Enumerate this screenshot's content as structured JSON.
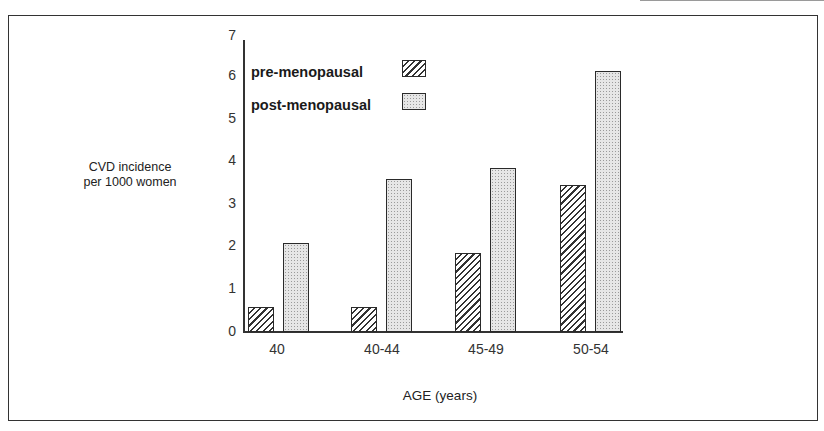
{
  "chart_data": {
    "type": "bar",
    "title": "",
    "xlabel": "AGE (years)",
    "ylabel": "CVD incidence per 1000 women",
    "ylabel_lines": [
      "CVD incidence",
      "per 1000 women"
    ],
    "categories": [
      "40",
      "40-44",
      "45-49",
      "50-54"
    ],
    "series": [
      {
        "name": "pre-menopausal",
        "pattern": "diagonal-hatch",
        "values": [
          0.6,
          0.6,
          1.85,
          3.45
        ]
      },
      {
        "name": "post-menopausal",
        "pattern": "stipple",
        "values": [
          2.1,
          3.6,
          3.85,
          6.15
        ]
      }
    ],
    "ylim": [
      0,
      7
    ],
    "yticks": [
      0,
      1,
      2,
      3,
      4,
      5,
      6,
      7
    ],
    "grid": false,
    "legend_position": "upper-left inside plot"
  },
  "colors": {
    "frame": "#333333",
    "bar_outline": "#2a2a2a",
    "stipple_fill": "#e6e6e6",
    "background": "#ffffff"
  }
}
